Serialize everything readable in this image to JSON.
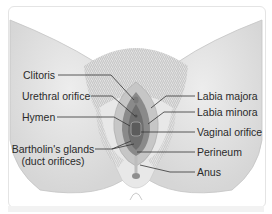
{
  "diagram": {
    "labels_left": [
      {
        "id": "clitoris",
        "text": "Clitoris"
      },
      {
        "id": "urethral-orifice",
        "text": "Urethral orifice"
      },
      {
        "id": "hymen",
        "text": "Hymen"
      },
      {
        "id": "bartholins-glands",
        "text": "Bartholin's glands",
        "text2": "(duct orifices)"
      }
    ],
    "labels_right": [
      {
        "id": "labia-majora",
        "text": "Labia majora"
      },
      {
        "id": "labia-minora",
        "text": "Labia minora"
      },
      {
        "id": "vaginal-orifice",
        "text": "Vaginal orifice"
      },
      {
        "id": "perineum",
        "text": "Perineum"
      },
      {
        "id": "anus",
        "text": "Anus"
      }
    ],
    "colors": {
      "skin": "#e6e6e6",
      "skin_shadow": "#cfcfcf",
      "hair": "#b8b8b8",
      "labia": "#8a8a8a",
      "vestibule": "#6e6e6e",
      "leader": "#333333",
      "text": "#2a2a2a"
    }
  }
}
